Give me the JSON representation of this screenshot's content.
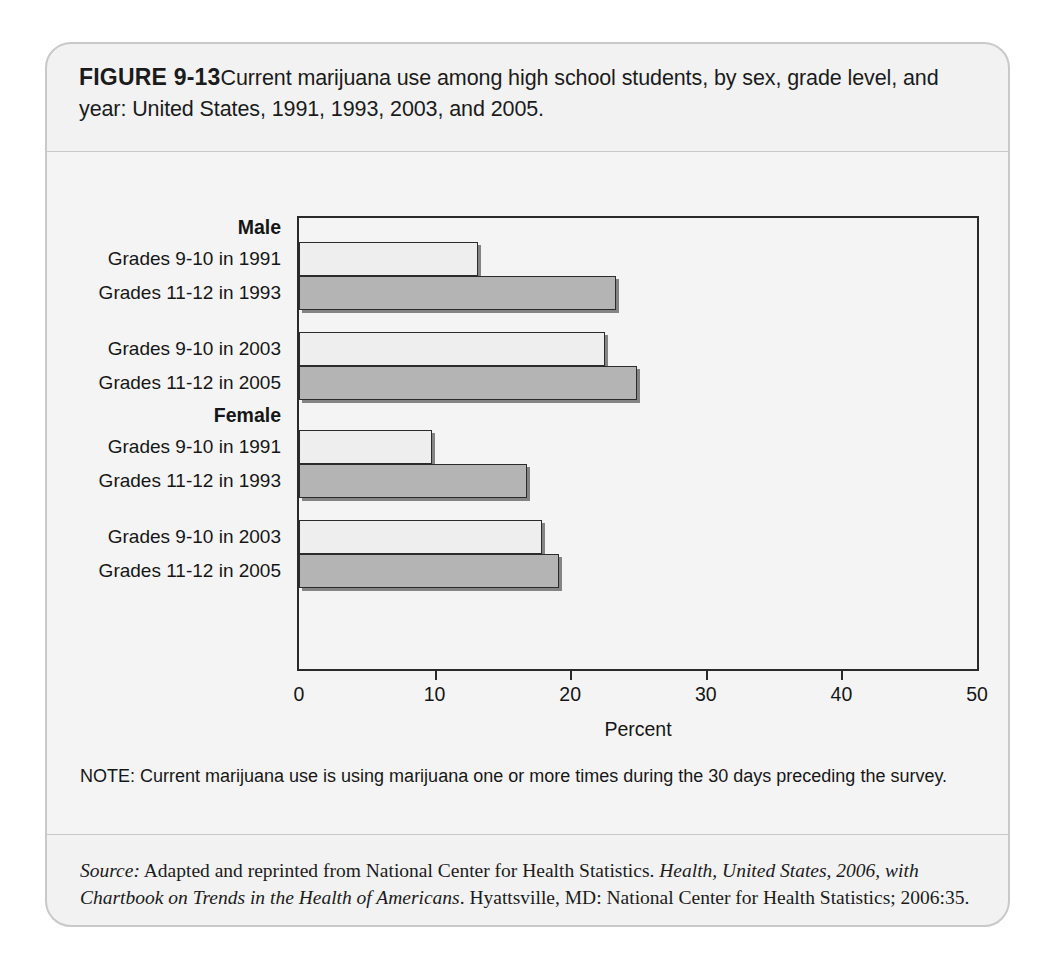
{
  "figure": {
    "label": "FIGURE 9-13",
    "caption": "Current marijuana use among high school students, by sex, grade level, and year: United States, 1991, 1993, 2003, and 2005.",
    "note": "NOTE: Current marijuana use is using marijuana one or more times during the 30 days preceding the survey.",
    "source_prefix": "Source:",
    "source_part1": " Adapted and reprinted from National Center for Health Statistics. ",
    "source_italic1": "Health, United States, 2006, with Chartbook on Trends in the Health of Americans",
    "source_part2": ". Hyattsville, MD: National Center for Health Statistics; 2006:35."
  },
  "chart_data": {
    "type": "bar",
    "orientation": "horizontal",
    "title": "Current marijuana use among high school students, by sex, grade level, and year: United States, 1991, 1993, 2003, and 2005.",
    "xlabel": "Percent",
    "ylabel": "",
    "xlim": [
      0,
      50
    ],
    "xticks": [
      0,
      10,
      20,
      30,
      40,
      50
    ],
    "xtick_labels": [
      "0",
      "10",
      "20",
      "30",
      "40",
      "50"
    ],
    "grid": false,
    "legend": "none",
    "groups": [
      {
        "name": "Male",
        "categories": [
          "Grades 9-10 in 1991",
          "Grades 11-12 in 1993",
          "Grades 9-10 in 2003",
          "Grades 11-12 in 2005"
        ],
        "values": [
          13.2,
          23.4,
          22.6,
          24.9
        ],
        "shades": [
          "light",
          "dark",
          "light",
          "dark"
        ]
      },
      {
        "name": "Female",
        "categories": [
          "Grades 9-10 in 1991",
          "Grades 11-12 in 1993",
          "Grades 9-10 in 2003",
          "Grades 11-12 in 2005"
        ],
        "values": [
          9.8,
          16.8,
          17.9,
          19.2
        ],
        "shades": [
          "light",
          "dark",
          "light",
          "dark"
        ]
      }
    ],
    "colors": {
      "light_bar": "#eeeeee",
      "dark_bar": "#b4b4b4",
      "bar_outline": "#2b2b2b",
      "plot_background": "#f4f4f4",
      "card_background": "#f2f2f2"
    }
  }
}
